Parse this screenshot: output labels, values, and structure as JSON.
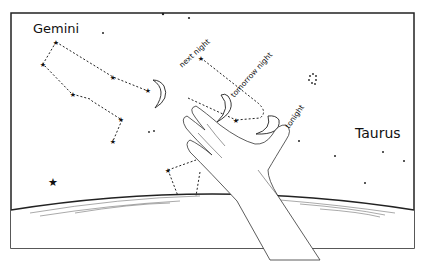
{
  "comic": {
    "constellations": {
      "gemini": "Gemini",
      "taurus": "Taurus"
    },
    "moon_labels": {
      "next_night": "next night",
      "tomorrow_night": "tomorrow night",
      "tonight": "tonight"
    }
  }
}
